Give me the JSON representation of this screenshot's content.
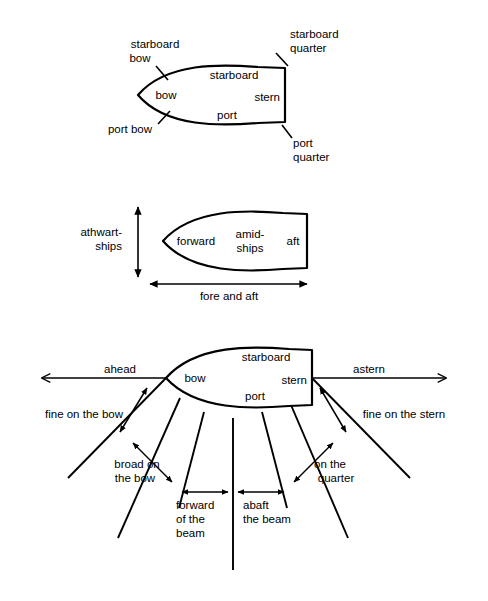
{
  "figure": {
    "background_color": "#ffffff",
    "line_color": "#000000",
    "text_color": "#000000"
  },
  "diagram1": {
    "name": "ship-parts-diagram",
    "labels": {
      "starboard_bow_line1": "starboard",
      "starboard_bow_line2": "bow",
      "starboard_quarter_line1": "starboard",
      "starboard_quarter_line2": "quarter",
      "port_bow": "port bow",
      "port_quarter_line1": "port",
      "port_quarter_line2": "quarter",
      "bow": "bow",
      "stern": "stern",
      "starboard": "starboard",
      "port": "port"
    }
  },
  "diagram2": {
    "name": "ship-axes-diagram",
    "labels": {
      "athwartships_line1": "athwart-",
      "athwartships_line2": "ships",
      "fore_and_aft": "fore and aft",
      "forward": "forward",
      "amidships_line1": "amid-",
      "amidships_line2": "ships",
      "aft": "aft"
    }
  },
  "diagram3": {
    "name": "relative-bearing-diagram",
    "labels": {
      "ahead": "ahead",
      "astern": "astern",
      "fine_on_the_bow": "fine on the bow",
      "fine_on_the_stern": "fine on the stern",
      "broad_on_the_bow_line1": "broad on",
      "broad_on_the_bow_line2": "the bow",
      "on_the_quarter_line1": "on the",
      "on_the_quarter_line2": "quarter",
      "forward_of_the_beam_line1": "forward",
      "forward_of_the_beam_line2": "of the",
      "forward_of_the_beam_line3": "beam",
      "abaft_the_beam_line1": "abaft",
      "abaft_the_beam_line2": "the beam",
      "bow": "bow",
      "stern": "stern",
      "starboard": "starboard",
      "port": "port"
    }
  }
}
